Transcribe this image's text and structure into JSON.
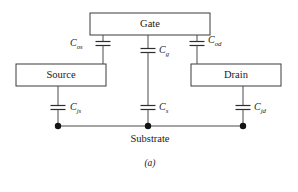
{
  "figure": {
    "caption": "(a)",
    "substrate_label": "Substrate",
    "boxes": [
      {
        "id": "gate",
        "label": "Gate"
      },
      {
        "id": "source",
        "label": "Source"
      },
      {
        "id": "drain",
        "label": "Drain"
      }
    ],
    "capacitors": [
      {
        "id": "cos",
        "base": "C",
        "sub": "os",
        "between": "gate-source-overlap"
      },
      {
        "id": "cg",
        "base": "C",
        "sub": "g",
        "between": "gate-substrate"
      },
      {
        "id": "cod",
        "base": "C",
        "sub": "od",
        "between": "gate-drain-overlap"
      },
      {
        "id": "cjs",
        "base": "C",
        "sub": "js",
        "between": "source-substrate"
      },
      {
        "id": "cs",
        "base": "C",
        "sub": "s",
        "between": "gate-node-substrate"
      },
      {
        "id": "cjd",
        "base": "C",
        "sub": "jd",
        "between": "drain-substrate"
      }
    ],
    "nodes": [
      {
        "id": "node-source-substrate"
      },
      {
        "id": "node-center-substrate"
      },
      {
        "id": "node-drain-substrate"
      }
    ],
    "colors": {
      "background": "#ffffff",
      "box_stroke": "#3a3a3a",
      "wire": "#4a4a4a",
      "node": "#141414",
      "text": "#1a1a1a"
    }
  }
}
